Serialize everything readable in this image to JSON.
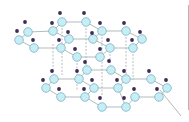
{
  "diagram": {
    "title": "",
    "colors": {
      "atom_fill": "#c6eef5",
      "atom_stroke": "#7fb3c4",
      "hydrogen": "#3f2a55",
      "bond": "#a9b3b8",
      "hbond": "#9aa3a8",
      "edge_line": "#b5b5b5",
      "pointer": "#9a9a9a"
    },
    "atoms": [
      {
        "layer": "upper",
        "x": 28,
        "y": 32
      },
      {
        "layer": "upper",
        "x": 19,
        "y": 40
      },
      {
        "layer": "upper",
        "x": 34,
        "y": 48
      },
      {
        "layer": "upper",
        "x": 53,
        "y": 31
      },
      {
        "layer": "upper",
        "x": 62,
        "y": 22
      },
      {
        "layer": "upper",
        "x": 86,
        "y": 22
      },
      {
        "layer": "upper",
        "x": 61,
        "y": 48
      },
      {
        "layer": "upper",
        "x": 69,
        "y": 39
      },
      {
        "layer": "upper",
        "x": 93,
        "y": 39
      },
      {
        "layer": "upper",
        "x": 102,
        "y": 31
      },
      {
        "layer": "upper",
        "x": 100,
        "y": 57
      },
      {
        "layer": "upper",
        "x": 77,
        "y": 57
      },
      {
        "layer": "upper",
        "x": 110,
        "y": 48
      },
      {
        "layer": "upper",
        "x": 126,
        "y": 31
      },
      {
        "layer": "upper",
        "x": 142,
        "y": 39
      },
      {
        "layer": "upper",
        "x": 133,
        "y": 48
      },
      {
        "layer": "lower",
        "x": 54,
        "y": 79
      },
      {
        "layer": "lower",
        "x": 46,
        "y": 88
      },
      {
        "layer": "lower",
        "x": 61,
        "y": 97
      },
      {
        "layer": "lower",
        "x": 79,
        "y": 79
      },
      {
        "layer": "lower",
        "x": 87,
        "y": 70
      },
      {
        "layer": "lower",
        "x": 111,
        "y": 70
      },
      {
        "layer": "lower",
        "x": 94,
        "y": 88
      },
      {
        "layer": "lower",
        "x": 85,
        "y": 97
      },
      {
        "layer": "lower",
        "x": 118,
        "y": 88
      },
      {
        "layer": "lower",
        "x": 126,
        "y": 79
      },
      {
        "layer": "lower",
        "x": 102,
        "y": 107
      },
      {
        "layer": "lower",
        "x": 126,
        "y": 107
      },
      {
        "layer": "lower",
        "x": 135,
        "y": 97
      },
      {
        "layer": "lower",
        "x": 151,
        "y": 79
      },
      {
        "layer": "lower",
        "x": 167,
        "y": 88
      },
      {
        "layer": "lower",
        "x": 159,
        "y": 97
      }
    ],
    "bonds": [
      [
        0,
        1
      ],
      [
        1,
        2
      ],
      [
        0,
        3
      ],
      [
        2,
        6
      ],
      [
        3,
        4
      ],
      [
        4,
        5
      ],
      [
        3,
        7
      ],
      [
        6,
        7
      ],
      [
        5,
        9
      ],
      [
        7,
        8
      ],
      [
        8,
        9
      ],
      [
        6,
        11
      ],
      [
        11,
        10
      ],
      [
        10,
        12
      ],
      [
        8,
        12
      ],
      [
        9,
        13
      ],
      [
        13,
        14
      ],
      [
        14,
        15
      ],
      [
        12,
        15
      ],
      [
        16,
        17
      ],
      [
        17,
        18
      ],
      [
        16,
        19
      ],
      [
        18,
        23
      ],
      [
        19,
        20
      ],
      [
        20,
        21
      ],
      [
        19,
        22
      ],
      [
        22,
        23
      ],
      [
        21,
        25
      ],
      [
        22,
        24
      ],
      [
        24,
        25
      ],
      [
        23,
        26
      ],
      [
        26,
        27
      ],
      [
        24,
        27
      ],
      [
        27,
        28
      ],
      [
        25,
        29
      ],
      [
        28,
        31
      ],
      [
        29,
        30
      ],
      [
        30,
        31
      ]
    ],
    "hbonds": [
      [
        53,
        44,
        53,
        72
      ],
      [
        62,
        28,
        62,
        75
      ],
      [
        86,
        28,
        86,
        65
      ],
      [
        102,
        37,
        102,
        95
      ],
      [
        126,
        37,
        126,
        75
      ],
      [
        77,
        63,
        77,
        90
      ],
      [
        110,
        54,
        110,
        65
      ],
      [
        133,
        54,
        133,
        80
      ]
    ],
    "hydrogens": [
      {
        "x": 25,
        "y": 22
      },
      {
        "x": 17,
        "y": 31
      },
      {
        "x": 33,
        "y": 40
      },
      {
        "x": 52,
        "y": 23
      },
      {
        "x": 60,
        "y": 13
      },
      {
        "x": 84,
        "y": 13
      },
      {
        "x": 59,
        "y": 40
      },
      {
        "x": 68,
        "y": 32
      },
      {
        "x": 92,
        "y": 33
      },
      {
        "x": 100,
        "y": 23
      },
      {
        "x": 75,
        "y": 49
      },
      {
        "x": 100,
        "y": 49
      },
      {
        "x": 108,
        "y": 40
      },
      {
        "x": 124,
        "y": 23
      },
      {
        "x": 140,
        "y": 32
      },
      {
        "x": 132,
        "y": 40
      },
      {
        "x": 85,
        "y": 62
      },
      {
        "x": 109,
        "y": 61
      },
      {
        "x": 52,
        "y": 71
      },
      {
        "x": 43,
        "y": 80
      },
      {
        "x": 59,
        "y": 89
      },
      {
        "x": 77,
        "y": 71
      },
      {
        "x": 92,
        "y": 80
      },
      {
        "x": 117,
        "y": 80
      },
      {
        "x": 124,
        "y": 71
      },
      {
        "x": 100,
        "y": 98
      },
      {
        "x": 124,
        "y": 98
      },
      {
        "x": 134,
        "y": 89
      },
      {
        "x": 149,
        "y": 71
      },
      {
        "x": 166,
        "y": 80
      },
      {
        "x": 157,
        "y": 89
      },
      {
        "x": 84,
        "y": 89
      }
    ],
    "edge_line": {
      "x": 189,
      "y1": 5,
      "y2": 110
    },
    "pointer": {
      "x1": 160,
      "y1": 90,
      "x2": 181,
      "y2": 116
    }
  }
}
